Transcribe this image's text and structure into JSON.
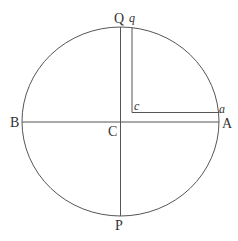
{
  "figure": {
    "stroke_color": "#555555",
    "circle": {
      "cx": 120.5,
      "cy": 121.5,
      "rx": 98.5,
      "ry": 94.5
    },
    "lines": [
      {
        "name": "diameter-QP",
        "x1": 120.5,
        "y1": 27,
        "x2": 120.5,
        "y2": 216
      },
      {
        "name": "diameter-BA",
        "x1": 22,
        "y1": 122,
        "x2": 219,
        "y2": 122
      },
      {
        "name": "line-qc",
        "x1": 132,
        "y1": 27.5,
        "x2": 132,
        "y2": 112.5
      },
      {
        "name": "line-ca",
        "x1": 132,
        "y1": 112.5,
        "x2": 219.5,
        "y2": 112.5
      }
    ],
    "labels": {
      "Q": "Q",
      "q": "q",
      "B": "B",
      "C": "C",
      "A": "A",
      "P": "P",
      "c": "c",
      "a": "a"
    }
  }
}
